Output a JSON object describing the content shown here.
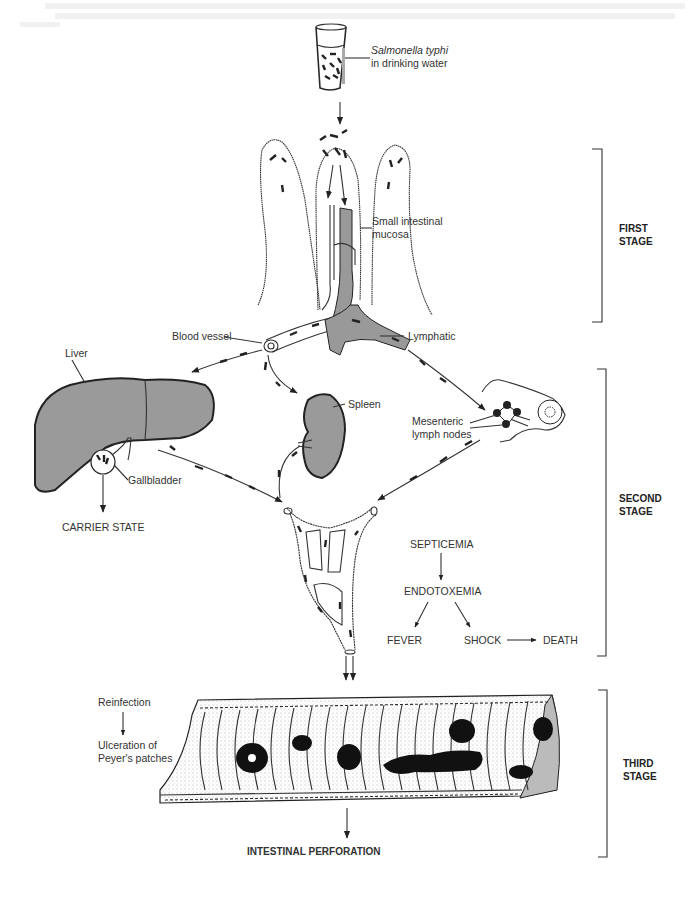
{
  "diagram": {
    "title_hint": "Pathogenesis of typhoid fever",
    "source_label": {
      "organism": "Salmonella typhi",
      "medium": "in drinking water"
    },
    "labels": {
      "small_intestinal_mucosa_1": "Small intestinal",
      "small_intestinal_mucosa_2": "mucosa",
      "blood_vessel": "Blood vessel",
      "lymphatic": "Lymphatic",
      "liver": "Liver",
      "spleen": "Spleen",
      "gallbladder": "Gallbladder",
      "mesenteric_1": "Mesenteric",
      "mesenteric_2": "lymph nodes",
      "carrier_state": "CARRIER STATE",
      "septicemia": "SEPTICEMIA",
      "endotoxemia": "ENDOTOXEMIA",
      "fever": "FEVER",
      "shock": "SHOCK",
      "death": "DEATH",
      "reinfection": "Reinfection",
      "ulceration_1": "Ulceration of",
      "ulceration_2": "Peyer's patches",
      "intestinal_perforation": "INTESTINAL PERFORATION"
    },
    "stages": [
      {
        "line1": "FIRST",
        "line2": "STAGE"
      },
      {
        "line1": "SECOND",
        "line2": "STAGE"
      },
      {
        "line1": "THIRD",
        "line2": "STAGE"
      }
    ],
    "flows": [
      {
        "from": "Salmonella typhi in drinking water",
        "to": "Small intestinal mucosa"
      },
      {
        "from": "Small intestinal mucosa",
        "to": "Blood vessel"
      },
      {
        "from": "Small intestinal mucosa",
        "to": "Lymphatic"
      },
      {
        "from": "Blood vessel",
        "to": "Liver"
      },
      {
        "from": "Blood vessel",
        "to": "Spleen"
      },
      {
        "from": "Lymphatic",
        "to": "Mesenteric lymph nodes"
      },
      {
        "from": "Gallbladder",
        "to": "CARRIER STATE"
      },
      {
        "from": "Liver",
        "to": "Bloodstream"
      },
      {
        "from": "Spleen",
        "to": "Bloodstream"
      },
      {
        "from": "Mesenteric lymph nodes",
        "to": "Bloodstream"
      },
      {
        "from": "SEPTICEMIA",
        "to": "ENDOTOXEMIA"
      },
      {
        "from": "ENDOTOXEMIA",
        "to": "FEVER"
      },
      {
        "from": "ENDOTOXEMIA",
        "to": "SHOCK"
      },
      {
        "from": "SHOCK",
        "to": "DEATH"
      },
      {
        "from": "Bloodstream",
        "to": "Intestine (Peyer's patches)"
      },
      {
        "from": "Reinfection",
        "to": "Ulceration of Peyer's patches"
      },
      {
        "from": "Intestine",
        "to": "INTESTINAL PERFORATION"
      }
    ],
    "colors": {
      "organ_fill": "#9a9a9a",
      "ink": "#222222",
      "background": "#ffffff"
    }
  }
}
